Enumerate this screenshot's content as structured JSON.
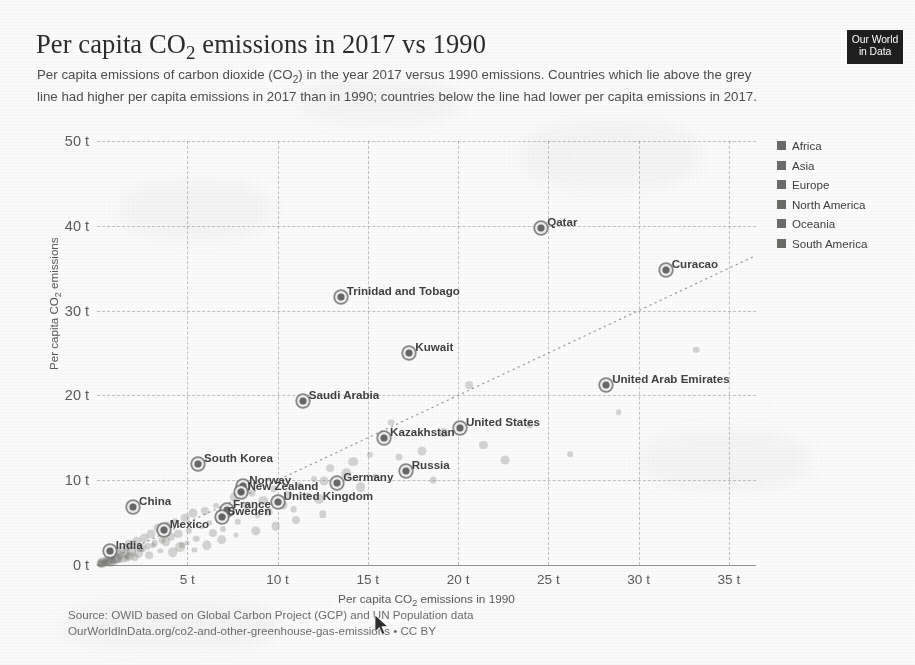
{
  "header": {
    "title_html": "Per capita CO<sub>2</sub> emissions in 2017 vs 1990",
    "title_text": "Per capita CO2 emissions in 2017 vs 1990",
    "subtitle_html": "Per capita emissions of carbon dioxide (CO<sub>2</sub>) in the year 2017 versus 1990 emissions. Countries which lie above the grey line had higher per capita emissions in 2017 than in 1990; countries below the line had lower per capita emissions in 2017.",
    "subtitle_text": "Per capita emissions of carbon dioxide (CO2) in the year 2017 versus 1990 emissions. Countries which lie above the grey line had higher per capita emissions in 2017 than in 1990; countries below the line had lower per capita emissions in 2017."
  },
  "logo": {
    "line1": "Our World",
    "line2": "in Data"
  },
  "legend": {
    "position": "right",
    "items": [
      {
        "label": "Africa",
        "color": "#6b6a67"
      },
      {
        "label": "Asia",
        "color": "#6b6a67"
      },
      {
        "label": "Europe",
        "color": "#6b6a67"
      },
      {
        "label": "North America",
        "color": "#6b6a67"
      },
      {
        "label": "Oceania",
        "color": "#6b6a67"
      },
      {
        "label": "South America",
        "color": "#6b6a67"
      }
    ]
  },
  "footer": {
    "line1": "Source: OWID based on Global Carbon Project (GCP) and UN Population data",
    "line2": "OurWorldInData.org/co2-and-other-greenhouse-gas-emissions • CC BY"
  },
  "chart_data": {
    "type": "scatter",
    "title": "Per capita CO2 emissions in 2017 vs 1990",
    "xlabel_html": "Per capita CO<sub>2</sub> emissions in 1990",
    "xlabel": "Per capita CO2 emissions in 1990",
    "ylabel_html": "Per capita CO<sub>2</sub> emissions",
    "ylabel": "Per capita CO2 emissions",
    "xlim": [
      0,
      36.5
    ],
    "ylim": [
      0,
      50
    ],
    "grid": true,
    "xticks": [
      5,
      10,
      15,
      20,
      25,
      30,
      35
    ],
    "xticklabels": [
      "5 t",
      "10 t",
      "15 t",
      "20 t",
      "25 t",
      "30 t",
      "35 t"
    ],
    "yticks": [
      0,
      10,
      20,
      30,
      40,
      50
    ],
    "yticklabels": [
      "0 t",
      "10 t",
      "20 t",
      "30 t",
      "40 t",
      "50 t"
    ],
    "reference_line": {
      "label": "parity line (y = x)",
      "style": "dotted",
      "color": "#9a9a9a",
      "from": [
        0,
        0
      ],
      "to": [
        36.5,
        36.5
      ]
    },
    "labeled_points": [
      {
        "name": "Qatar",
        "x": 24.6,
        "y": 39.7,
        "label_pos": "right"
      },
      {
        "name": "Curacao",
        "x": 31.5,
        "y": 34.8,
        "label_pos": "right"
      },
      {
        "name": "Trinidad and Tobago",
        "x": 13.5,
        "y": 31.6,
        "label_pos": "right"
      },
      {
        "name": "Kuwait",
        "x": 17.3,
        "y": 25.0,
        "label_pos": "right"
      },
      {
        "name": "United Arab Emirates",
        "x": 28.2,
        "y": 21.2,
        "label_pos": "right"
      },
      {
        "name": "Saudi Arabia",
        "x": 11.4,
        "y": 19.3,
        "label_pos": "right"
      },
      {
        "name": "United States",
        "x": 20.1,
        "y": 16.2,
        "label_pos": "right"
      },
      {
        "name": "Kazakhstan",
        "x": 15.9,
        "y": 15.0,
        "label_pos": "right"
      },
      {
        "name": "Russia",
        "x": 17.1,
        "y": 11.1,
        "label_pos": "right"
      },
      {
        "name": "South Korea",
        "x": 5.6,
        "y": 11.9,
        "label_pos": "right"
      },
      {
        "name": "Germany",
        "x": 13.3,
        "y": 9.7,
        "label_pos": "right"
      },
      {
        "name": "Norway",
        "x": 8.1,
        "y": 9.3,
        "label_pos": "right"
      },
      {
        "name": "New Zealand",
        "x": 8.0,
        "y": 8.6,
        "label_pos": "right"
      },
      {
        "name": "United Kingdom",
        "x": 10.0,
        "y": 7.4,
        "label_pos": "right"
      },
      {
        "name": "France",
        "x": 7.2,
        "y": 6.5,
        "label_pos": "right"
      },
      {
        "name": "Sweden",
        "x": 6.9,
        "y": 5.7,
        "label_pos": "right"
      },
      {
        "name": "China",
        "x": 2.0,
        "y": 6.8,
        "label_pos": "right"
      },
      {
        "name": "Mexico",
        "x": 3.7,
        "y": 4.1,
        "label_pos": "right"
      },
      {
        "name": "India",
        "x": 0.7,
        "y": 1.7,
        "label_pos": "right"
      }
    ],
    "unlabeled_points": [
      {
        "x": 0.3,
        "y": 0.4
      },
      {
        "x": 0.4,
        "y": 0.3
      },
      {
        "x": 0.5,
        "y": 0.6
      },
      {
        "x": 0.6,
        "y": 0.5
      },
      {
        "x": 0.2,
        "y": 0.2
      },
      {
        "x": 0.8,
        "y": 0.9
      },
      {
        "x": 0.9,
        "y": 0.6
      },
      {
        "x": 1.0,
        "y": 1.2
      },
      {
        "x": 1.1,
        "y": 0.8
      },
      {
        "x": 1.2,
        "y": 1.5
      },
      {
        "x": 1.3,
        "y": 1.0
      },
      {
        "x": 1.4,
        "y": 1.8
      },
      {
        "x": 1.5,
        "y": 1.3
      },
      {
        "x": 1.6,
        "y": 2.1
      },
      {
        "x": 1.7,
        "y": 1.1
      },
      {
        "x": 1.8,
        "y": 2.5
      },
      {
        "x": 1.9,
        "y": 1.6
      },
      {
        "x": 2.2,
        "y": 2.8
      },
      {
        "x": 2.4,
        "y": 1.9
      },
      {
        "x": 2.6,
        "y": 3.2
      },
      {
        "x": 2.8,
        "y": 2.2
      },
      {
        "x": 3.0,
        "y": 3.6
      },
      {
        "x": 3.2,
        "y": 2.6
      },
      {
        "x": 3.4,
        "y": 4.4
      },
      {
        "x": 3.6,
        "y": 2.9
      },
      {
        "x": 3.9,
        "y": 4.8
      },
      {
        "x": 4.1,
        "y": 3.3
      },
      {
        "x": 4.3,
        "y": 5.2
      },
      {
        "x": 4.5,
        "y": 3.7
      },
      {
        "x": 4.7,
        "y": 2.4
      },
      {
        "x": 4.9,
        "y": 5.6
      },
      {
        "x": 5.1,
        "y": 4.0
      },
      {
        "x": 5.3,
        "y": 6.1
      },
      {
        "x": 5.5,
        "y": 3.1
      },
      {
        "x": 5.8,
        "y": 4.5
      },
      {
        "x": 6.0,
        "y": 6.4
      },
      {
        "x": 6.2,
        "y": 5.0
      },
      {
        "x": 6.4,
        "y": 3.8
      },
      {
        "x": 6.6,
        "y": 7.0
      },
      {
        "x": 6.8,
        "y": 5.4
      },
      {
        "x": 7.0,
        "y": 4.2
      },
      {
        "x": 7.4,
        "y": 6.2
      },
      {
        "x": 7.6,
        "y": 8.0
      },
      {
        "x": 7.8,
        "y": 5.1
      },
      {
        "x": 8.3,
        "y": 6.9
      },
      {
        "x": 8.6,
        "y": 8.5
      },
      {
        "x": 8.9,
        "y": 5.9
      },
      {
        "x": 9.2,
        "y": 7.6
      },
      {
        "x": 9.5,
        "y": 6.3
      },
      {
        "x": 9.8,
        "y": 9.0
      },
      {
        "x": 10.3,
        "y": 7.1
      },
      {
        "x": 10.6,
        "y": 8.3
      },
      {
        "x": 10.9,
        "y": 6.6
      },
      {
        "x": 11.2,
        "y": 9.4
      },
      {
        "x": 11.7,
        "y": 8.1
      },
      {
        "x": 12.0,
        "y": 10.2
      },
      {
        "x": 12.3,
        "y": 7.8
      },
      {
        "x": 12.6,
        "y": 9.9
      },
      {
        "x": 12.9,
        "y": 11.4
      },
      {
        "x": 13.8,
        "y": 10.8
      },
      {
        "x": 14.2,
        "y": 12.2
      },
      {
        "x": 14.6,
        "y": 9.2
      },
      {
        "x": 15.1,
        "y": 13.0
      },
      {
        "x": 15.4,
        "y": 10.5
      },
      {
        "x": 16.3,
        "y": 16.8
      },
      {
        "x": 16.7,
        "y": 12.7
      },
      {
        "x": 18.0,
        "y": 13.5
      },
      {
        "x": 18.6,
        "y": 10.0
      },
      {
        "x": 19.2,
        "y": 15.6
      },
      {
        "x": 20.6,
        "y": 21.2
      },
      {
        "x": 21.4,
        "y": 14.2
      },
      {
        "x": 22.6,
        "y": 12.4
      },
      {
        "x": 24.0,
        "y": 16.5
      },
      {
        "x": 26.2,
        "y": 13.1
      },
      {
        "x": 28.9,
        "y": 18.0
      },
      {
        "x": 33.2,
        "y": 25.4
      },
      {
        "x": 2.1,
        "y": 0.9
      },
      {
        "x": 2.3,
        "y": 1.4
      },
      {
        "x": 2.5,
        "y": 2.0
      },
      {
        "x": 2.9,
        "y": 1.2
      },
      {
        "x": 3.1,
        "y": 2.3
      },
      {
        "x": 3.5,
        "y": 1.7
      },
      {
        "x": 3.8,
        "y": 2.7
      },
      {
        "x": 4.2,
        "y": 1.5
      },
      {
        "x": 4.6,
        "y": 2.1
      },
      {
        "x": 5.0,
        "y": 2.6
      },
      {
        "x": 5.4,
        "y": 1.8
      },
      {
        "x": 6.1,
        "y": 2.3
      },
      {
        "x": 6.9,
        "y": 3.0
      },
      {
        "x": 7.7,
        "y": 3.5
      },
      {
        "x": 8.8,
        "y": 4.0
      },
      {
        "x": 9.9,
        "y": 4.6
      },
      {
        "x": 11.0,
        "y": 5.3
      },
      {
        "x": 12.5,
        "y": 6.0
      },
      {
        "x": 0.15,
        "y": 0.1
      },
      {
        "x": 0.25,
        "y": 0.15
      },
      {
        "x": 0.35,
        "y": 0.25
      },
      {
        "x": 0.45,
        "y": 0.35
      },
      {
        "x": 0.55,
        "y": 0.2
      },
      {
        "x": 0.65,
        "y": 0.45
      },
      {
        "x": 0.75,
        "y": 0.3
      },
      {
        "x": 0.85,
        "y": 0.55
      },
      {
        "x": 0.95,
        "y": 0.4
      },
      {
        "x": 1.05,
        "y": 0.7
      },
      {
        "x": 1.25,
        "y": 0.6
      },
      {
        "x": 1.45,
        "y": 0.85
      },
      {
        "x": 1.65,
        "y": 0.75
      },
      {
        "x": 1.85,
        "y": 1.05
      }
    ]
  }
}
